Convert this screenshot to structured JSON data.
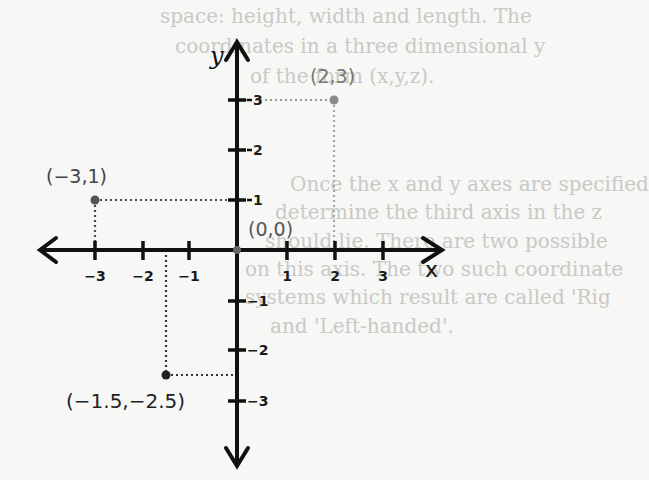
{
  "background_text": {
    "lines": [
      {
        "text": "space: height, width and length. The",
        "x": 160,
        "y": 22
      },
      {
        "text": "coordinates in a three dimensional y",
        "x": 175,
        "y": 52
      },
      {
        "text": "of the form (x,y,z).",
        "x": 250,
        "y": 82
      },
      {
        "text": "Once the x and y axes are specified",
        "x": 290,
        "y": 190
      },
      {
        "text": "determine the third axis in the z",
        "x": 275,
        "y": 218
      },
      {
        "text": "should lie. There are two possible",
        "x": 265,
        "y": 247
      },
      {
        "text": "on this axis. The two such coordinate",
        "x": 245,
        "y": 275
      },
      {
        "text": "systems which result are called 'Rig",
        "x": 245,
        "y": 303
      },
      {
        "text": "and 'Left-handed'.",
        "x": 270,
        "y": 332
      }
    ]
  },
  "axes": {
    "x_label": "x",
    "y_label": "y",
    "x_ticks": [
      {
        "value": -3,
        "label": "−3"
      },
      {
        "value": -2,
        "label": "−2"
      },
      {
        "value": -1,
        "label": "−1"
      },
      {
        "value": 1,
        "label": "1"
      },
      {
        "value": 2,
        "label": "2"
      },
      {
        "value": 3,
        "label": "3"
      }
    ],
    "y_ticks": [
      {
        "value": 3,
        "label": "3"
      },
      {
        "value": 2,
        "label": "2"
      },
      {
        "value": 1,
        "label": "1"
      },
      {
        "value": -1,
        "label": "−1"
      },
      {
        "value": -2,
        "label": "−2"
      },
      {
        "value": -3,
        "label": "−3"
      }
    ]
  },
  "points": [
    {
      "x": 2,
      "y": 3,
      "label": "(2,3)",
      "color": "#8a8a8a"
    },
    {
      "x": -3,
      "y": 1,
      "label": "(−3,1)",
      "color": "#555555"
    },
    {
      "x": 0,
      "y": 0,
      "label": "(0,0)",
      "color": "#777777"
    },
    {
      "x": -1.5,
      "y": -2.5,
      "label": "(−1.5,−2.5)",
      "color": "#222222"
    }
  ],
  "colors": {
    "axis": "#111111",
    "background": "#f7f7f5",
    "faint_text": "#c9c9c6"
  }
}
